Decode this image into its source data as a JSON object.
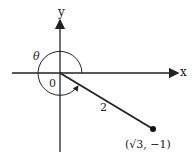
{
  "diagram": {
    "axis_x_label": "x",
    "axis_y_label": "y",
    "angle_label": "θ",
    "origin_label": "0",
    "segment_length_label": "2",
    "point_label": "(√3, −1)",
    "colors": {
      "stroke": "#222222"
    }
  }
}
